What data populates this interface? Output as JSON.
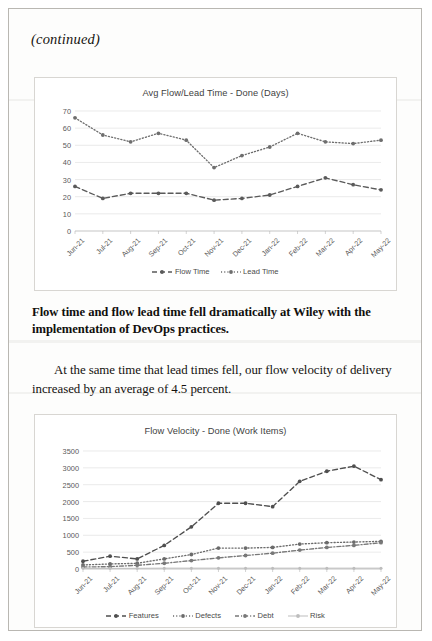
{
  "page": {
    "continued_label": "(continued)",
    "bold_paragraph": "Flow time and flow lead time fell dramatically at Wiley with the implementation of DevOps practices.",
    "body_paragraph": "At the same time that lead times fell, our flow velocity of delivery increased by an average of 4.5 percent."
  },
  "chart_data": [
    {
      "type": "line",
      "id": "flow-lead-time",
      "title": "Avg Flow/Lead Time - Done (Days)",
      "xlabel": "",
      "ylabel": "",
      "ylim": [
        0,
        70
      ],
      "yticks": [
        0,
        10,
        20,
        30,
        40,
        50,
        60,
        70
      ],
      "grid": true,
      "legend_position": "bottom",
      "categories": [
        "Jun-21",
        "Jul-21",
        "Aug-21",
        "Sep-21",
        "Oct-21",
        "Nov-21",
        "Dec-21",
        "Jan-22",
        "Feb-22",
        "Mar-22",
        "Apr-22",
        "May-22"
      ],
      "series": [
        {
          "name": "Flow Time",
          "style": "dashed",
          "color": "#5a5a5a",
          "values": [
            26,
            19,
            22,
            22,
            22,
            18,
            19,
            21,
            26,
            31,
            27,
            24,
            21
          ]
        },
        {
          "name": "Lead Time",
          "style": "dotted",
          "color": "#6e6e6e",
          "values": [
            66,
            56,
            52,
            57,
            53,
            37,
            44,
            49,
            57,
            52,
            51,
            53,
            48
          ]
        }
      ]
    },
    {
      "type": "line",
      "id": "flow-velocity",
      "title": "Flow Velocity - Done (Work Items)",
      "xlabel": "",
      "ylabel": "",
      "ylim": [
        0,
        3500
      ],
      "yticks": [
        0,
        500,
        1000,
        1500,
        2000,
        2500,
        3000,
        3500
      ],
      "grid": true,
      "legend_position": "bottom",
      "categories": [
        "Jun-21",
        "Jul-21",
        "Aug-21",
        "Sep-21",
        "Oct-21",
        "Nov-21",
        "Dec-21",
        "Jan-22",
        "Feb-22",
        "Mar-22",
        "Apr-22",
        "May-22"
      ],
      "series": [
        {
          "name": "Features",
          "style": "dashed",
          "color": "#4f4f4f",
          "values": [
            230,
            380,
            300,
            700,
            1250,
            1950,
            1950,
            1850,
            2600,
            2900,
            3050,
            2650
          ]
        },
        {
          "name": "Defects",
          "style": "dotted",
          "color": "#6b6b6b",
          "values": [
            120,
            150,
            170,
            300,
            430,
            620,
            620,
            640,
            740,
            780,
            800,
            820
          ]
        },
        {
          "name": "Debt",
          "style": "dashdot",
          "color": "#787878",
          "values": [
            60,
            70,
            110,
            170,
            250,
            330,
            400,
            470,
            560,
            640,
            700,
            780
          ]
        },
        {
          "name": "Risk",
          "style": "solid-light",
          "color": "#bdbdbd",
          "values": [
            20,
            20,
            20,
            25,
            25,
            25,
            25,
            25,
            25,
            25,
            25,
            25
          ]
        }
      ]
    }
  ]
}
